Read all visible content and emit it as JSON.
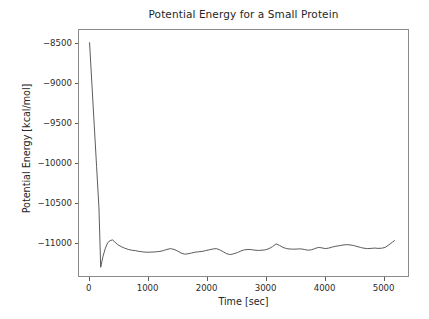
{
  "chart_data": {
    "type": "line",
    "title": "Potential Energy for a Small Protein",
    "xlabel": "Time [sec]",
    "ylabel": "Potential Energy [kcal/mol]",
    "xlim": [
      -180,
      5430
    ],
    "ylim": [
      -11430,
      -8330
    ],
    "xticks": [
      0,
      1000,
      2000,
      3000,
      4000,
      5000
    ],
    "xtick_labels": [
      "0",
      "1000",
      "2000",
      "3000",
      "4000",
      "5000"
    ],
    "yticks": [
      -8500,
      -9000,
      -9500,
      -10000,
      -10500,
      -11000
    ],
    "ytick_labels": [
      "−8500",
      "−9000",
      "−9500",
      "−10000",
      "−10500",
      "−11000"
    ],
    "grid": false,
    "legend": null,
    "line_color": "#4a4a4a",
    "line_width": 0.9,
    "background_color": "#ffffff",
    "axes_color": "#8a8a8a",
    "series": [
      {
        "name": "Potential Energy",
        "x": [
          0,
          40,
          80,
          120,
          160,
          190,
          230,
          270,
          310,
          350,
          390,
          430,
          480,
          540,
          600,
          660,
          720,
          780,
          840,
          900,
          960,
          1020,
          1080,
          1140,
          1200,
          1260,
          1320,
          1380,
          1440,
          1500,
          1560,
          1620,
          1680,
          1740,
          1800,
          1860,
          1920,
          1980,
          2040,
          2100,
          2160,
          2220,
          2280,
          2340,
          2400,
          2460,
          2520,
          2580,
          2640,
          2700,
          2760,
          2820,
          2880,
          2940,
          3000,
          3060,
          3120,
          3180,
          3240,
          3300,
          3360,
          3420,
          3480,
          3540,
          3600,
          3660,
          3720,
          3780,
          3840,
          3900,
          3960,
          4020,
          4080,
          4140,
          4200,
          4260,
          4320,
          4380,
          4440,
          4500,
          4560,
          4620,
          4680,
          4740,
          4800,
          4860,
          4920,
          4980,
          5040,
          5100,
          5160,
          5200
        ],
        "y": [
          -8490,
          -9010,
          -9530,
          -10050,
          -10570,
          -11320,
          -11180,
          -11080,
          -11010,
          -10985,
          -10975,
          -11000,
          -11035,
          -11060,
          -11080,
          -11095,
          -11105,
          -11110,
          -11120,
          -11125,
          -11130,
          -11130,
          -11128,
          -11125,
          -11120,
          -11110,
          -11095,
          -11085,
          -11095,
          -11115,
          -11140,
          -11155,
          -11150,
          -11140,
          -11130,
          -11125,
          -11120,
          -11110,
          -11100,
          -11090,
          -11085,
          -11100,
          -11125,
          -11150,
          -11160,
          -11150,
          -11135,
          -11115,
          -11100,
          -11095,
          -11098,
          -11105,
          -11108,
          -11105,
          -11100,
          -11085,
          -11060,
          -11025,
          -11045,
          -11070,
          -11085,
          -11090,
          -11092,
          -11090,
          -11088,
          -11095,
          -11105,
          -11100,
          -11085,
          -11070,
          -11075,
          -11085,
          -11078,
          -11065,
          -11055,
          -11048,
          -11040,
          -11035,
          -11038,
          -11045,
          -11058,
          -11070,
          -11080,
          -11085,
          -11082,
          -11078,
          -11082,
          -11080,
          -11070,
          -11040,
          -11005,
          -10985
        ]
      }
    ]
  }
}
